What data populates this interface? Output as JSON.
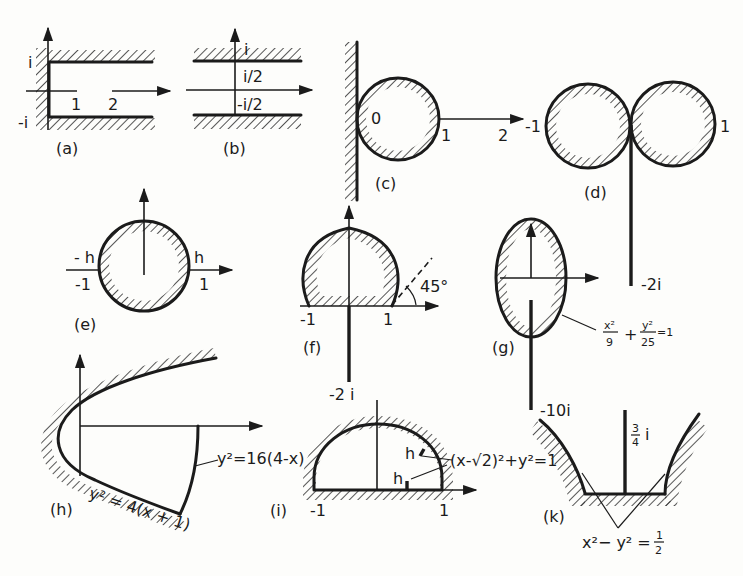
{
  "figure": {
    "panels": [
      {
        "id": "a",
        "caption": "(a)",
        "labels": {
          "top": "i",
          "bottom": "-i",
          "one": "1",
          "two": "2"
        }
      },
      {
        "id": "b",
        "caption": "(b)",
        "labels": {
          "top": "i",
          "upper_half": "i/2",
          "lower_half": "-i/2"
        }
      },
      {
        "id": "c",
        "caption": "(c)",
        "labels": {
          "origin": "0",
          "one": "1",
          "two": "2"
        }
      },
      {
        "id": "d",
        "caption": "(d)",
        "labels": {
          "left": "-1",
          "right": "1",
          "cut_end": "-2i"
        }
      },
      {
        "id": "e",
        "caption": "(e)",
        "labels": {
          "minus_h": "- h",
          "plus_h": "h",
          "minus_one": "-1",
          "one": "1"
        }
      },
      {
        "id": "f",
        "caption": "(f)",
        "labels": {
          "minus_one": "-1",
          "one": "1",
          "angle": "45°",
          "cut_end": "-2 i"
        }
      },
      {
        "id": "g",
        "caption": "(g)",
        "labels": {
          "cut_end": "-10i",
          "eq_x_num": "x²",
          "eq_x_den": "9",
          "eq_plus": "+",
          "eq_y_num": "y²",
          "eq_y_den": "25",
          "eq_rhs": "=1"
        }
      },
      {
        "id": "h",
        "caption": "(h)",
        "labels": {
          "outer_eq": "y² = 4(x + 1)",
          "inner_eq": "y²=16(4-x)"
        }
      },
      {
        "id": "i",
        "caption": "(i)",
        "labels": {
          "minus_one": "-1",
          "one": "1",
          "h_upper": "h",
          "h_lower": "h",
          "eq": "(x-√2)²+y²=1"
        }
      },
      {
        "id": "k",
        "caption": "(k)",
        "labels": {
          "top": "i",
          "top_num": "3",
          "top_den": "4",
          "eq_lhs": "x²− y² =",
          "eq_num": "1",
          "eq_den": "2"
        }
      }
    ]
  }
}
